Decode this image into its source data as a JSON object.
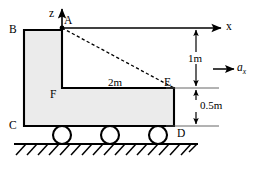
{
  "figure": {
    "type": "engineering-free-body-diagram",
    "colors": {
      "body_fill": "#ebebeb",
      "outline": "#000000",
      "thin_line": "#555555",
      "background": "#ffffff"
    }
  },
  "points": {
    "A": {
      "label": "A",
      "x": 62,
      "y": 28
    },
    "B": {
      "label": "B",
      "x": 24,
      "y": 30
    },
    "C": {
      "label": "C",
      "x": 24,
      "y": 126
    },
    "D": {
      "label": "D",
      "x": 174,
      "y": 126
    },
    "E": {
      "label": "E",
      "x": 174,
      "y": 88
    },
    "F": {
      "label": "F",
      "x": 62,
      "y": 88
    }
  },
  "axes": {
    "z_label": "z",
    "x_label": "x",
    "origin_x": 62,
    "origin_y": 28
  },
  "dimensions": [
    {
      "id": "height-upper",
      "label": "1m",
      "value": 1,
      "unit": "m",
      "from": "x-axis",
      "to": "E-level"
    },
    {
      "id": "width-FE",
      "label": "2m",
      "value": 2,
      "unit": "m",
      "from": "F",
      "to": "E"
    },
    {
      "id": "height-lower",
      "label": "0.5m",
      "value": 0.5,
      "unit": "m",
      "from": "E-level",
      "to": "D-level"
    }
  ],
  "acceleration": {
    "symbol": "a",
    "subscript": "x",
    "direction": "right"
  },
  "wheels": {
    "count": 3,
    "radius": 9,
    "centers_x": [
      62,
      110,
      158
    ],
    "center_y": 135
  },
  "ground": {
    "hatching": true,
    "hatch_count": 17,
    "line_y": 144
  }
}
